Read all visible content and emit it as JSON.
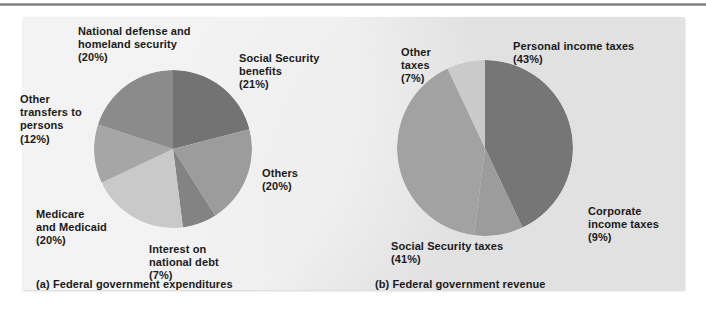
{
  "figure": {
    "background_color": "#e9e9e9",
    "page_color": "#ffffff",
    "text_color": "#1a1a1a"
  },
  "captions": {
    "left": "(a) Federal government expenditures",
    "right": "(b) Federal government revenue"
  },
  "labels": {
    "national_defense": "National defense and\nhomeland security\n(20%)",
    "social_security_benefits": "Social Security\nbenefits\n(21%)",
    "other_transfers": "Other\ntransfers to\npersons\n(12%)",
    "medicare_medicaid": "Medicare\nand Medicaid\n(20%)",
    "interest_national_debt": "Interest on\nnational debt\n(7%)",
    "others": "Others\n(20%)",
    "personal_income_taxes": "Personal income taxes\n(43%)",
    "other_taxes": "Other\ntaxes\n(7%)",
    "corporate_income_taxes": "Corporate\nincome taxes\n(9%)",
    "social_security_taxes": "Social Security taxes\n(41%)"
  },
  "chart_data": [
    {
      "type": "pie",
      "title": "(a) Federal government expenditures",
      "center_px": [
        173,
        149
      ],
      "radius_px": 79,
      "start_angle_deg": 0,
      "direction": "clockwise",
      "legend": "labels-outside",
      "categories": [
        "Social Security benefits",
        "Others",
        "Interest on national debt",
        "Medicare and Medicaid",
        "Other transfers to persons",
        "National defense and homeland security"
      ],
      "values": [
        21,
        20,
        7,
        20,
        12,
        20
      ],
      "unit": "percent",
      "colors": [
        "#737373",
        "#9c9c9c",
        "#838383",
        "#c9c9c9",
        "#a6a6a6",
        "#8b8b8b"
      ]
    },
    {
      "type": "pie",
      "title": "(b) Federal government revenue",
      "center_px": [
        485,
        148
      ],
      "radius_px": 88,
      "start_angle_deg": 0,
      "direction": "clockwise",
      "legend": "labels-outside",
      "categories": [
        "Personal income taxes",
        "Corporate income taxes",
        "Social Security taxes",
        "Other taxes"
      ],
      "values": [
        43,
        9,
        41,
        7
      ],
      "unit": "percent",
      "colors": [
        "#767676",
        "#9c9c9c",
        "#a2a2a2",
        "#cacaca"
      ]
    }
  ]
}
